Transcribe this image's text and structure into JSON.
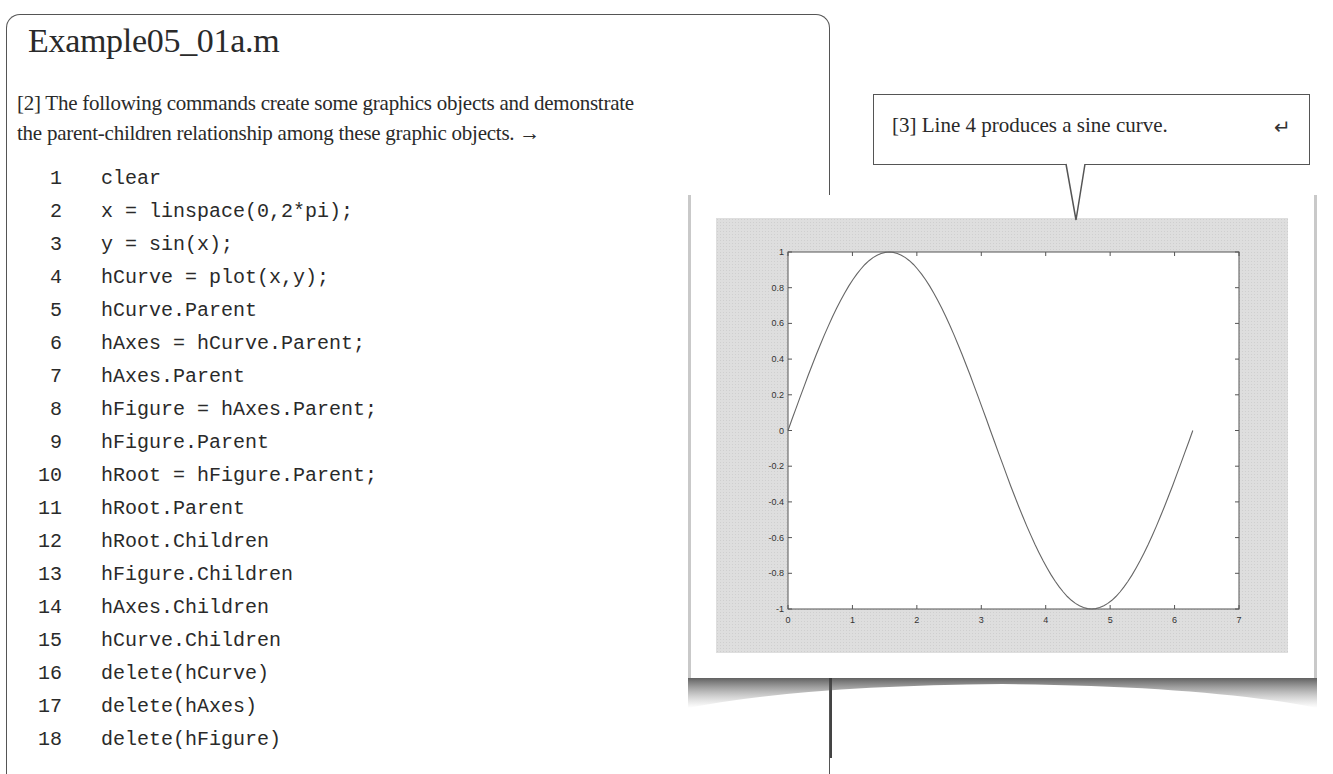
{
  "listing": {
    "title": "Example05_01a.m",
    "description_lines": [
      "[2] The following commands create some graphics objects and demonstrate",
      "the parent-children relationship among these graphic objects.  →"
    ],
    "code": [
      {
        "n": "1",
        "src": "clear"
      },
      {
        "n": "2",
        "src": "x = linspace(0,2*pi);"
      },
      {
        "n": "3",
        "src": "y = sin(x);"
      },
      {
        "n": "4",
        "src": "hCurve = plot(x,y);"
      },
      {
        "n": "5",
        "src": "hCurve.Parent"
      },
      {
        "n": "6",
        "src": "hAxes = hCurve.Parent;"
      },
      {
        "n": "7",
        "src": "hAxes.Parent"
      },
      {
        "n": "8",
        "src": "hFigure = hAxes.Parent;"
      },
      {
        "n": "9",
        "src": "hFigure.Parent"
      },
      {
        "n": "10",
        "src": "hRoot = hFigure.Parent;"
      },
      {
        "n": "11",
        "src": "hRoot.Parent"
      },
      {
        "n": "12",
        "src": "hRoot.Children"
      },
      {
        "n": "13",
        "src": "hFigure.Children"
      },
      {
        "n": "14",
        "src": "hAxes.Children"
      },
      {
        "n": "15",
        "src": "hCurve.Children"
      },
      {
        "n": "16",
        "src": "delete(hCurve)"
      },
      {
        "n": "17",
        "src": "delete(hAxes)"
      },
      {
        "n": "18",
        "src": "delete(hFigure)"
      }
    ]
  },
  "callout": {
    "text": "[3] Line 4 produces a sine curve.",
    "icon": "↵"
  },
  "figure": {
    "line_color": "#666666",
    "canvas_color": "#dedede",
    "axes_color": "#ffffff"
  },
  "chart_data": {
    "type": "line",
    "title": "",
    "xlabel": "",
    "ylabel": "",
    "xlim": [
      0,
      7
    ],
    "ylim": [
      -1,
      1
    ],
    "grid": false,
    "x_ticks": [
      "0",
      "1",
      "2",
      "3",
      "4",
      "5",
      "6",
      "7"
    ],
    "y_ticks": [
      "1",
      "0.8",
      "0.6",
      "0.4",
      "0.2",
      "0",
      "-0.2",
      "-0.4",
      "-0.6",
      "-0.8",
      "-1"
    ],
    "series": [
      {
        "name": "sin(x)",
        "function": "y = sin(x)",
        "x": [
          0,
          0.5,
          1.0,
          1.5708,
          2.0,
          2.5,
          3.1416,
          3.5,
          4.0,
          4.7124,
          5.0,
          5.5,
          6.0,
          6.2832
        ],
        "y": [
          0,
          0.479,
          0.841,
          1.0,
          0.909,
          0.598,
          0,
          -0.351,
          -0.757,
          -1.0,
          -0.959,
          -0.706,
          -0.279,
          0
        ]
      }
    ]
  }
}
